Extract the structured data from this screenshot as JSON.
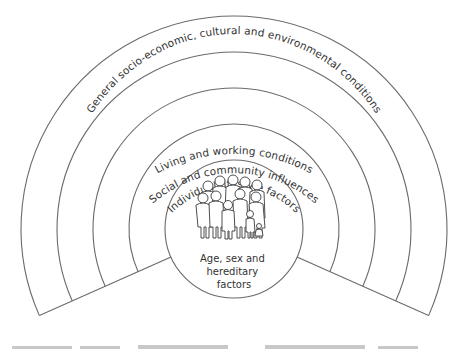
{
  "diagram": {
    "layers": [
      {
        "label": "General socio-economic, cultural and environmental conditions"
      },
      {
        "label": "Living and working conditions"
      },
      {
        "label": "Social and community influences"
      },
      {
        "label": "Individual lifestyle factors"
      }
    ],
    "core": {
      "lines": [
        "Age, sex and",
        "hereditary",
        "factors"
      ],
      "icon": "group-of-people-icon"
    },
    "colors": {
      "stroke": "#6a6a6a",
      "text": "#333333",
      "background": "#ffffff"
    }
  }
}
